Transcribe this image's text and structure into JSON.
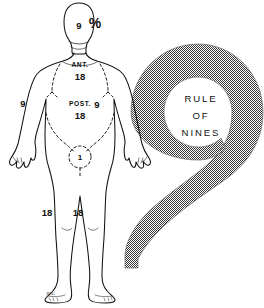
{
  "illustration": {
    "title": "Rule of Nines",
    "background_color": "#ffffff",
    "ink_color": "#111111",
    "halftone_color": "#808080"
  },
  "body_diagram": {
    "name": "anterior-human-figure",
    "view": "anterior",
    "percent_symbol": "%",
    "signature": "JHG",
    "regions": [
      {
        "id": "head",
        "label": "9",
        "sublabel": "",
        "percent": 9
      },
      {
        "id": "trunk-anterior",
        "label": "18",
        "sublabel": "ANT.",
        "percent": 18
      },
      {
        "id": "trunk-posterior",
        "label": "18",
        "sublabel": "POST.",
        "percent": 18
      },
      {
        "id": "arm-right",
        "label": "9",
        "sublabel": "",
        "percent": 9
      },
      {
        "id": "arm-left",
        "label": "9",
        "sublabel": "",
        "percent": 9
      },
      {
        "id": "perineum",
        "label": "1",
        "sublabel": "",
        "percent": 1
      },
      {
        "id": "leg-right",
        "label": "18",
        "sublabel": "",
        "percent": 18
      },
      {
        "id": "leg-left",
        "label": "18",
        "sublabel": "",
        "percent": 18
      }
    ]
  },
  "nine_emblem": {
    "name": "big-numeral-nine",
    "fill_pattern": "halftone-checker",
    "caption_lines": [
      "RULE",
      "OF",
      "NINES"
    ]
  }
}
